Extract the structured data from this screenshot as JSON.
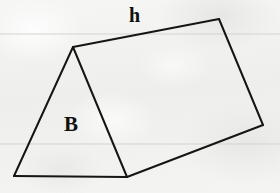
{
  "figure": {
    "kind": "triangular-prism-diagram",
    "background_color": "#f1f1f0",
    "ink_color": "#151515",
    "rule_line_color": "#d3d3d0",
    "stroke_width": 2,
    "canvas": {
      "width": 280,
      "height": 193
    },
    "vertices": {
      "front_apex": {
        "x": 73,
        "y": 47
      },
      "front_bottom_left": {
        "x": 14,
        "y": 176
      },
      "front_bottom_right": {
        "x": 127,
        "y": 177
      },
      "back_apex": {
        "x": 219,
        "y": 19
      },
      "back_bottom": {
        "x": 263,
        "y": 125
      }
    },
    "edges": [
      {
        "name": "front-triangle-left-side",
        "from": "front_apex",
        "to": "front_bottom_left"
      },
      {
        "name": "front-triangle-base",
        "from": "front_bottom_left",
        "to": "front_bottom_right"
      },
      {
        "name": "front-triangle-right-side",
        "from": "front_bottom_right",
        "to": "front_apex"
      },
      {
        "name": "top-ridge",
        "from": "front_apex",
        "to": "back_apex"
      },
      {
        "name": "back-triangle-right-side",
        "from": "back_apex",
        "to": "back_bottom"
      },
      {
        "name": "bottom-slant",
        "from": "back_bottom",
        "to": "front_bottom_right"
      }
    ],
    "ruled_lines": [
      {
        "name": "upper-ruled-line",
        "y": 34
      },
      {
        "name": "lower-ruled-line",
        "y": 144
      }
    ],
    "labels": {
      "height_label": {
        "text": "h",
        "x": 129,
        "y": 5,
        "font_size": 20,
        "meaning": "slant-height-of-prism"
      },
      "base_label": {
        "text": "B",
        "x": 64,
        "y": 114,
        "font_size": 21,
        "meaning": "area-of-triangular-base"
      }
    }
  }
}
